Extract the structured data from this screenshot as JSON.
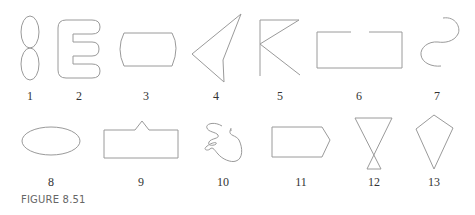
{
  "figure": {
    "caption": "FIGURE 8.51",
    "stroke_color": "#9a9a9a",
    "shapes": [
      {
        "id": 1,
        "label": "1",
        "description": "figure-eight (two stacked ovals)"
      },
      {
        "id": 2,
        "label": "2",
        "description": "rounded letter E outline"
      },
      {
        "id": 3,
        "label": "3",
        "description": "rectangle with convex rounded ends"
      },
      {
        "id": 4,
        "label": "4",
        "description": "concave arrowhead quadrilateral"
      },
      {
        "id": 5,
        "label": "5",
        "description": "K-like open polyline"
      },
      {
        "id": 6,
        "label": "6",
        "description": "rectangle with gap in top edge"
      },
      {
        "id": 7,
        "label": "7",
        "description": "S-curve"
      },
      {
        "id": 8,
        "label": "8",
        "description": "ellipse"
      },
      {
        "id": 9,
        "label": "9",
        "description": "rectangle with peaked notch on top"
      },
      {
        "id": 10,
        "label": "10",
        "description": "scribble"
      },
      {
        "id": 11,
        "label": "11",
        "description": "pentagon arrow shape"
      },
      {
        "id": 12,
        "label": "12",
        "description": "hourglass (crossed triangles)"
      },
      {
        "id": 13,
        "label": "13",
        "description": "kite"
      }
    ]
  }
}
